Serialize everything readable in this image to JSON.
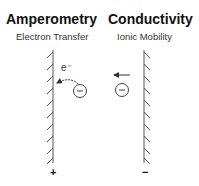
{
  "panels": [
    {
      "title": "Amperometry",
      "subtitle": "Electron Transfer",
      "polarity": "+",
      "electron_label": "e⁻",
      "ion_symbol": "−"
    },
    {
      "title": "Conductivity",
      "subtitle": "Ionic Mobility",
      "polarity": "−",
      "ion_symbol": "−"
    }
  ],
  "colors": {
    "line": "#555555",
    "text": "#111111"
  }
}
